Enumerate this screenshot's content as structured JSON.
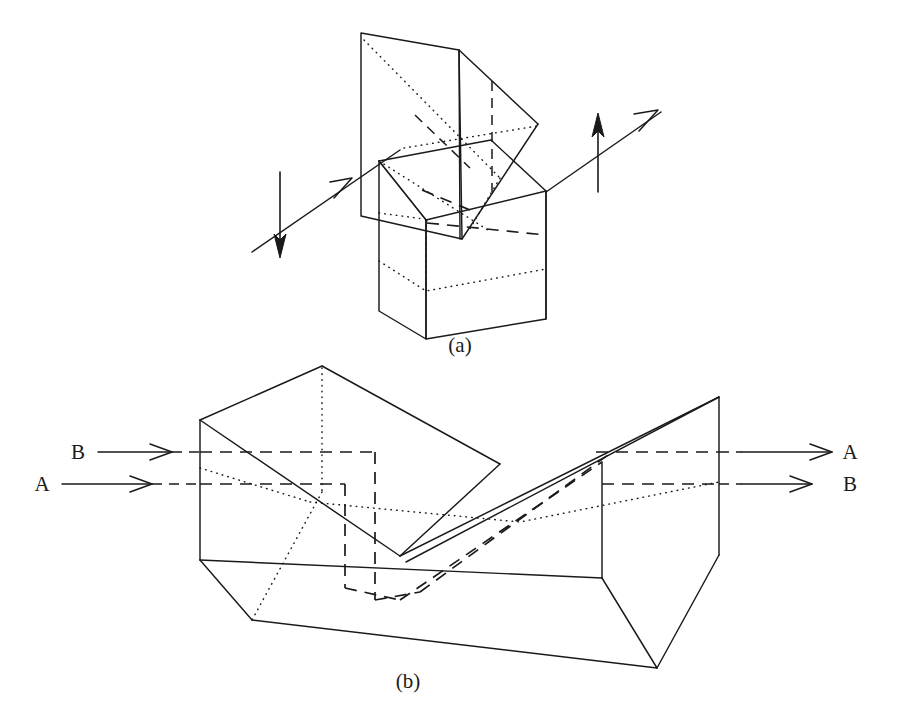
{
  "figure": {
    "background_color": "#ffffff",
    "line_color": "#1a1a1a",
    "width": 906,
    "height": 719
  },
  "panels": [
    {
      "id": "panel-a",
      "label": "(a)",
      "label_x": 460,
      "label_y": 352,
      "description": "Perspective view of a roof prism assembly with an entering ray and an exiting ray, each accompanied by a transverse polarization arrow.",
      "rays": [
        {
          "name": "input-ray",
          "direction": "up-right",
          "style": "solid"
        },
        {
          "name": "output-ray",
          "direction": "up-right",
          "style": "solid"
        }
      ],
      "polarization_arrows": [
        {
          "name": "input-polarization",
          "direction": "down"
        },
        {
          "name": "output-polarization",
          "direction": "up"
        }
      ]
    },
    {
      "id": "panel-b",
      "label": "(b)",
      "label_x": 408,
      "label_y": 688,
      "description": "Wide roof prism shown with two horizontal rays A and B entering on the left and emerging on the right with their order inverted.",
      "ray_labels": {
        "left_upper": "B",
        "left_lower": "A",
        "right_upper": "A",
        "right_lower": "B"
      },
      "left_labels": [
        {
          "text": "B",
          "x": 78,
          "y": 452
        },
        {
          "text": "A",
          "x": 42,
          "y": 484
        }
      ],
      "right_labels": [
        {
          "text": "A",
          "x": 848,
          "y": 452
        },
        {
          "text": "B",
          "x": 848,
          "y": 484
        }
      ]
    }
  ],
  "geometry": {
    "panel_a": {
      "upper_prism_front_face": "361,33 361,215 460,238 458,50",
      "upper_prism_roof_right": "458,50 537,123 460,238",
      "upper_prism_roof_ridge": "458,50 458,238",
      "upper_prism_dotted_diag": "361,33 502,172",
      "upper_prism_dotted_lower": "402,145 537,123",
      "upper_prism_dashed_vert": "491,83 491,190",
      "lower_body_top_face": "378,161 492,140 545,190 425,219",
      "lower_body_front_left": "378,161 378,310 425,219",
      "lower_body_front_right": "425,219 425,338 545,318 545,190",
      "lower_body_bottom": "378,310 425,338",
      "lower_body_dotted_back": "378,260 425,290 545,268",
      "lower_body_dashed_ridge": "425,219 545,232",
      "lower_body_dotted_diag": "378,161 492,230",
      "input_ray": "265,242 395,152",
      "output_ray": "545,190 660,113",
      "input_pol_arrow": "280,173 280,253",
      "output_pol_arrow": "598,188 598,116"
    },
    "panel_b": {
      "top_apex": "322,366",
      "left_vertex": "200,420",
      "right_top_vertex": "719,397",
      "bottom_right_vertex": "657,668",
      "v_bottom": "400,556",
      "left_front_face": "200,420 200,560 310,620 310,470",
      "roof_left_panel": "200,420 322,366 400,556 310,470",
      "roof_right_panel": "322,366 430,430 400,556",
      "right_wedge": "400,556 719,397 719,555",
      "bottom_slab": "200,560 252,620 657,668 719,555",
      "ray_A_in_y": 484,
      "ray_B_in_y": 452,
      "ray_A_out_y": 452,
      "ray_B_out_y": 484
    }
  }
}
